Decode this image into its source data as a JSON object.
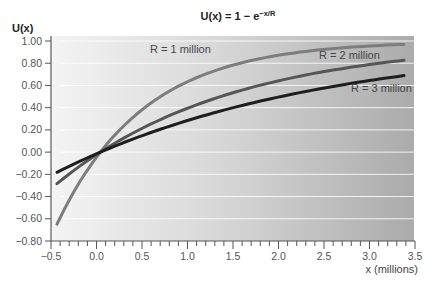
{
  "chart_data": {
    "type": "line",
    "title": "U(x) = 1 − e",
    "title_exponent": "−x/R",
    "xlabel": "x (millions)",
    "ylabel": "U(x)",
    "xlim": [
      -0.5,
      3.5
    ],
    "ylim": [
      -0.8,
      1.0
    ],
    "x_ticks": [
      "−0.5",
      "0.0",
      "0.5",
      "1.0",
      "1.5",
      "2.0",
      "2.5",
      "3.0",
      "3.5"
    ],
    "x_tick_values": [
      -0.5,
      0.0,
      0.5,
      1.0,
      1.5,
      2.0,
      2.5,
      3.0,
      3.5
    ],
    "x_minor_step": 0.1,
    "y_ticks": [
      "1.00",
      "0.80",
      "0.60",
      "0.40",
      "0.20",
      "0.00",
      "−0.20",
      "−0.40",
      "−0.60",
      "−0.80"
    ],
    "y_tick_values": [
      1.0,
      0.8,
      0.6,
      0.4,
      0.2,
      0.0,
      -0.2,
      -0.4,
      -0.6,
      -0.8
    ],
    "grid": true,
    "function": "1 - exp(-x/R)",
    "series": [
      {
        "name": "R = 1 million",
        "R": 1,
        "color": "#7d7d7d",
        "x": [
          -0.5,
          0.0,
          0.5,
          1.0,
          1.5,
          2.0,
          2.5,
          3.0,
          3.5
        ],
        "values": [
          -0.65,
          0.0,
          0.39,
          0.63,
          0.78,
          0.86,
          0.92,
          0.95,
          0.97
        ]
      },
      {
        "name": "R = 2 million",
        "R": 2,
        "color": "#565656",
        "x": [
          -0.5,
          0.0,
          0.5,
          1.0,
          1.5,
          2.0,
          2.5,
          3.0,
          3.5
        ],
        "values": [
          -0.28,
          0.0,
          0.22,
          0.39,
          0.53,
          0.63,
          0.71,
          0.78,
          0.83
        ]
      },
      {
        "name": "R = 3 million",
        "R": 3,
        "color": "#1e1e1e",
        "x": [
          -0.5,
          0.0,
          0.5,
          1.0,
          1.5,
          2.0,
          2.5,
          3.0,
          3.5
        ],
        "values": [
          -0.18,
          0.0,
          0.15,
          0.28,
          0.39,
          0.49,
          0.57,
          0.63,
          0.69
        ]
      }
    ],
    "annotations": [
      {
        "text": "R = 1 million",
        "series": 0
      },
      {
        "text": "R = 2 million",
        "series": 1
      },
      {
        "text": "R = 3 million",
        "series": 2
      }
    ]
  }
}
